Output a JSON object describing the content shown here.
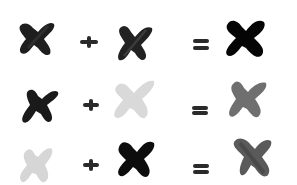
{
  "rows": [
    {
      "operand_a": {
        "shape": "x-mark",
        "color": "#1e1e1e",
        "opacity": 0.92
      },
      "operator_1": "+",
      "operand_b": {
        "shape": "x-mark",
        "color": "#222222",
        "opacity": 0.88
      },
      "operator_2": "=",
      "result": {
        "shape": "x-mark",
        "color": "#050505",
        "opacity": 1.0
      }
    },
    {
      "operand_a": {
        "shape": "x-mark",
        "color": "#1a1a1a",
        "opacity": 0.92
      },
      "operator_1": "+",
      "operand_b": {
        "shape": "x-mark",
        "color": "#d9d9d9",
        "opacity": 1.0
      },
      "operator_2": "=",
      "result": {
        "shape": "x-mark",
        "color": "#6f6f6f",
        "opacity": 1.0
      }
    },
    {
      "operand_a": {
        "shape": "x-mark",
        "color": "#d6d6d6",
        "opacity": 1.0
      },
      "operator_1": "+",
      "operand_b": {
        "shape": "x-mark",
        "color": "#0d0d0d",
        "opacity": 1.0
      },
      "operator_2": "=",
      "result": {
        "shape": "x-mark",
        "color": "#5a5a5a",
        "opacity": 1.0
      }
    }
  ]
}
